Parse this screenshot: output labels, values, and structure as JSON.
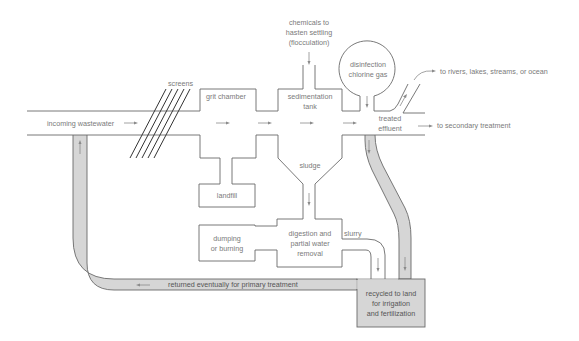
{
  "diagram": {
    "type": "process-flow",
    "colors": {
      "line": "#6a6a6a",
      "text": "#7a7a7a",
      "recycle_pipe_fill": "#d6d6d6",
      "screens": "#333333",
      "background": "#ffffff"
    },
    "labels": {
      "incoming": "incoming wastewater",
      "screens": "screens",
      "grit_chamber": "grit chamber",
      "chemicals_line1": "chemicals to",
      "chemicals_line2": "hasten settling",
      "chemicals_line3": "(flocculation)",
      "sedimentation_line1": "sedimentation",
      "sedimentation_line2": "tank",
      "disinfection_line1": "disinfection",
      "disinfection_line2": "chlorine gas",
      "treated_line1": "treated",
      "treated_line2": "effluent",
      "to_rivers": "to rivers, lakes, streams, or ocean",
      "to_secondary": "to secondary treatment",
      "sludge": "sludge",
      "landfill": "landfill",
      "dumping_line1": "dumping",
      "dumping_line2": "or burning",
      "digestion_line1": "digestion and",
      "digestion_line2": "partial water",
      "digestion_line3": "removal",
      "slurry": "slurry",
      "recycled_line1": "recycled to land",
      "recycled_line2": "for irrigation",
      "recycled_line3": "and fertilization",
      "returned": "returned eventually for primary treatment"
    },
    "nodes": [
      {
        "id": "screens",
        "label": "screens"
      },
      {
        "id": "grit_chamber",
        "label": "grit chamber"
      },
      {
        "id": "sedimentation_tank",
        "label": "sedimentation tank"
      },
      {
        "id": "disinfection",
        "label": "disinfection chlorine gas"
      },
      {
        "id": "treated_effluent",
        "label": "treated effluent"
      },
      {
        "id": "landfill",
        "label": "landfill"
      },
      {
        "id": "sludge",
        "label": "sludge"
      },
      {
        "id": "digestion",
        "label": "digestion and partial water removal"
      },
      {
        "id": "dumping",
        "label": "dumping or burning"
      },
      {
        "id": "recycled",
        "label": "recycled to land for irrigation and fertilization"
      }
    ],
    "edges": [
      {
        "from": "incoming wastewater",
        "to": "screens"
      },
      {
        "from": "screens",
        "to": "grit_chamber"
      },
      {
        "from": "grit_chamber",
        "to": "sedimentation_tank"
      },
      {
        "from": "chemicals to hasten settling (flocculation)",
        "to": "sedimentation_tank"
      },
      {
        "from": "sedimentation_tank",
        "to": "treated_effluent"
      },
      {
        "from": "disinfection",
        "to": "treated_effluent"
      },
      {
        "from": "treated_effluent",
        "to": "to rivers, lakes, streams, or ocean"
      },
      {
        "from": "treated_effluent",
        "to": "to secondary treatment"
      },
      {
        "from": "treated_effluent",
        "to": "recycled"
      },
      {
        "from": "grit_chamber",
        "to": "landfill"
      },
      {
        "from": "sedimentation_tank",
        "to": "sludge"
      },
      {
        "from": "sludge",
        "to": "digestion"
      },
      {
        "from": "digestion",
        "to": "dumping"
      },
      {
        "from": "digestion",
        "to": "recycled",
        "label": "slurry"
      },
      {
        "from": "recycled",
        "to": "incoming wastewater",
        "label": "returned eventually for primary treatment"
      }
    ]
  }
}
